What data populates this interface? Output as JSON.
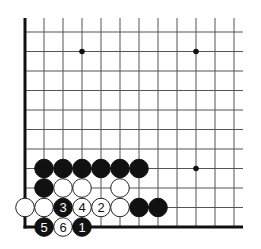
{
  "diagram": {
    "type": "go-board-fragment",
    "board_section": "lower-left corner",
    "geometry": {
      "origin_x": 25,
      "origin_y": 32,
      "col_spacing": 19,
      "row_spacing": 19.5,
      "cols": 12,
      "rows": 11,
      "line_top": 18,
      "line_right": 243,
      "stone_radius": 9.3
    },
    "edges": {
      "left": true,
      "bottom": true,
      "top": false,
      "right": false
    },
    "colors": {
      "background": "#ffffff",
      "grid": "#555555",
      "edge": "#111111",
      "black_stone": "#111111",
      "white_stone": "#ffffff",
      "white_outline": "#222222",
      "label_on_black": "#ffffff",
      "label_on_white": "#111111"
    },
    "star_points": [
      {
        "col": 3,
        "row": 1
      },
      {
        "col": 9,
        "row": 1
      },
      {
        "col": 9,
        "row": 7
      }
    ],
    "stones": [
      {
        "color": "black",
        "col": 1,
        "row": 7,
        "label": ""
      },
      {
        "color": "black",
        "col": 2,
        "row": 7,
        "label": ""
      },
      {
        "color": "black",
        "col": 3,
        "row": 7,
        "label": ""
      },
      {
        "color": "black",
        "col": 4,
        "row": 7,
        "label": ""
      },
      {
        "color": "black",
        "col": 5,
        "row": 7,
        "label": ""
      },
      {
        "color": "black",
        "col": 6,
        "row": 7,
        "label": ""
      },
      {
        "color": "black",
        "col": 1,
        "row": 8,
        "label": ""
      },
      {
        "color": "white",
        "col": 2,
        "row": 8,
        "label": ""
      },
      {
        "color": "white",
        "col": 3,
        "row": 8,
        "label": ""
      },
      {
        "color": "white",
        "col": 5,
        "row": 8,
        "label": ""
      },
      {
        "color": "white",
        "col": 0,
        "row": 9,
        "label": ""
      },
      {
        "color": "white",
        "col": 1,
        "row": 9,
        "label": ""
      },
      {
        "color": "black",
        "col": 2,
        "row": 9,
        "label": "3"
      },
      {
        "color": "white",
        "col": 3,
        "row": 9,
        "label": "4"
      },
      {
        "color": "white",
        "col": 4,
        "row": 9,
        "label": "2"
      },
      {
        "color": "white",
        "col": 5,
        "row": 9,
        "label": ""
      },
      {
        "color": "black",
        "col": 6,
        "row": 9,
        "label": ""
      },
      {
        "color": "black",
        "col": 7,
        "row": 9,
        "label": ""
      },
      {
        "color": "black",
        "col": 1,
        "row": 10,
        "label": "5"
      },
      {
        "color": "white",
        "col": 2,
        "row": 10,
        "label": "6"
      },
      {
        "color": "black",
        "col": 3,
        "row": 10,
        "label": "1"
      }
    ],
    "move_sequence": [
      {
        "move": 1,
        "color": "black",
        "col": 3,
        "row": 10
      },
      {
        "move": 2,
        "color": "white",
        "col": 4,
        "row": 9
      },
      {
        "move": 3,
        "color": "black",
        "col": 2,
        "row": 9
      },
      {
        "move": 4,
        "color": "white",
        "col": 3,
        "row": 9
      },
      {
        "move": 5,
        "color": "black",
        "col": 1,
        "row": 10
      },
      {
        "move": 6,
        "color": "white",
        "col": 2,
        "row": 10
      }
    ]
  }
}
